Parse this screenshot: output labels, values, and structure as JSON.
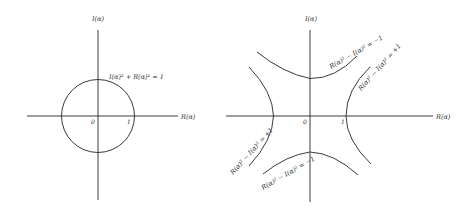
{
  "left_diagram": {
    "title": "Unit circle",
    "y_axis_label": "I(α)",
    "x_axis_label": "R(α)",
    "origin_label": "0",
    "unit_label": "1",
    "curve_label": "I(α)² + R(α)² = 1"
  },
  "right_diagram": {
    "title": "Unit hyperbolas",
    "y_axis_label": "I(α)",
    "x_axis_label": "R(α)",
    "origin_label": "0",
    "unit_label": "1",
    "labels": {
      "top": "R(α)² − I(α)² = −1",
      "right": "R(α)² − I(α)² = +1",
      "left": "R(α)² − I(α)² = +1",
      "bottom": "R(α)² − I(α)² = −1"
    }
  },
  "colors": {
    "ink": "#3a3a3a",
    "background": "#ffffff"
  }
}
